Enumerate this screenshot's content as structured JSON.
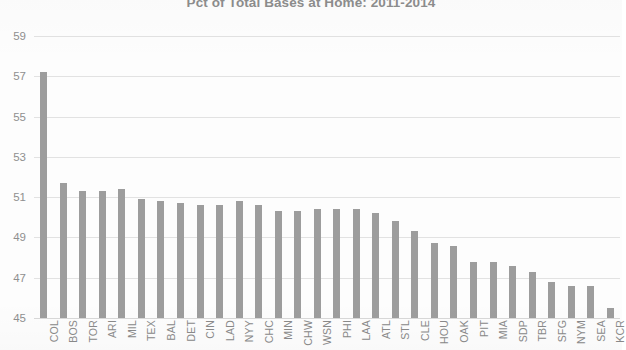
{
  "chart_data": {
    "type": "bar",
    "title": "Pct of Total Bases at Home: 2011-2014",
    "xlabel": "",
    "ylabel": "",
    "ylim": [
      45,
      59
    ],
    "yticks": [
      45,
      47,
      49,
      51,
      53,
      55,
      57,
      59
    ],
    "grid": true,
    "legend": "none",
    "bar_color": "#9d9d9d",
    "axis_text_color": "#8a8a8a",
    "gridline_color": "#e2e2e2",
    "categories": [
      "COL",
      "BOS",
      "TOR",
      "ARI",
      "MIL",
      "TEX",
      "BAL",
      "DET",
      "CIN",
      "LAD",
      "NYY",
      "CHC",
      "MIN",
      "CHW",
      "WSN",
      "PHI",
      "LAA",
      "ATL",
      "STL",
      "CLE",
      "HOU",
      "OAK",
      "PIT",
      "MIA",
      "SDP",
      "TBR",
      "SFG",
      "NYM",
      "SEA",
      "KCR"
    ],
    "values": [
      57.2,
      51.7,
      51.3,
      51.3,
      51.4,
      50.9,
      50.8,
      50.7,
      50.6,
      50.6,
      50.8,
      50.6,
      50.3,
      50.3,
      50.4,
      50.4,
      50.4,
      50.2,
      49.8,
      49.3,
      48.7,
      48.6,
      47.8,
      47.8,
      47.6,
      47.3,
      46.8,
      46.6,
      46.6,
      45.5
    ],
    "series": [
      {
        "name": "Pct of Total Bases at Home",
        "values": [
          57.2,
          51.7,
          51.3,
          51.3,
          51.4,
          50.9,
          50.8,
          50.7,
          50.6,
          50.6,
          50.8,
          50.6,
          50.3,
          50.3,
          50.4,
          50.4,
          50.4,
          50.2,
          49.8,
          49.3,
          48.7,
          48.6,
          47.8,
          47.8,
          47.6,
          47.3,
          46.8,
          46.6,
          46.6,
          45.5
        ]
      }
    ]
  }
}
